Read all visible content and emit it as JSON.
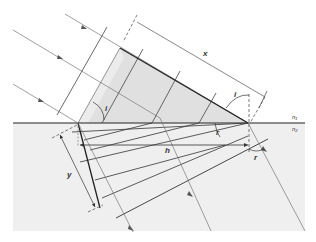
{
  "diagram": {
    "labels": {
      "x": "x",
      "y": "y",
      "h": "h",
      "i_upper_left": "i",
      "i_upper_right": "i",
      "r_interface": "r",
      "r_lower": "r",
      "n1": "n₁",
      "n2": "n₂"
    },
    "media": {
      "upper": {
        "name": "n1",
        "color": "#ffffff"
      },
      "lower": {
        "name": "n2",
        "color": "#eeeeee"
      }
    },
    "colors": {
      "wavefront_shade": "#e2e2e2",
      "lower_medium": "#efefef",
      "line": "#444444",
      "ray": "#666666",
      "interface": "#222222"
    }
  }
}
